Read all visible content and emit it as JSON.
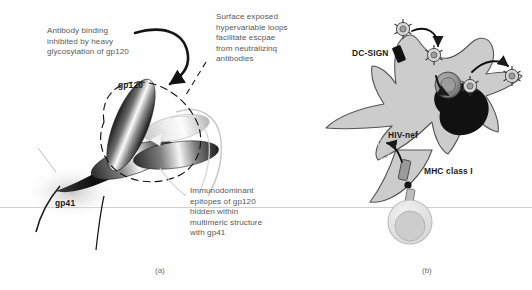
{
  "figure": {
    "background": "#fefefe",
    "membrane_color": "#c9c9c9",
    "text_color": "#58595b",
    "label_color": "#1a1a1a"
  },
  "panel_a": {
    "caption": "(a)",
    "annotations": [
      {
        "name": "antibody-binding-note",
        "text": "Antibody binding\ninhibited by heavy\nglycosylation of gp120"
      },
      {
        "name": "hypervariable-loops-note",
        "text": "Surface exposed\nhypervariable loops\nfacilitate escpae\nfrom neutralizinq\nantibodies"
      },
      {
        "name": "immunodominant-epitopes-note",
        "text": "Immunodominant\nepitopes of gp120\nhidden within\nmultimeric structure\nwith gp41"
      }
    ],
    "structure_labels": [
      {
        "name": "gp120-label",
        "text": "gp120"
      },
      {
        "name": "gp41-label",
        "text": "gp41"
      }
    ]
  },
  "panel_b": {
    "caption": "(b)",
    "structure_labels": [
      {
        "name": "dc-sign-label",
        "text": "DC-SIGN"
      },
      {
        "name": "hiv-nef-label",
        "text": "HIV-nef"
      },
      {
        "name": "mhc-class-i-label",
        "text": "MHC class I"
      }
    ],
    "elements": [
      {
        "name": "dendritic-cell",
        "kind": "cell-body"
      },
      {
        "name": "nucleus",
        "kind": "organelle"
      },
      {
        "name": "endosome",
        "kind": "organelle"
      },
      {
        "name": "virion",
        "kind": "virus-particle",
        "count": 5
      },
      {
        "name": "t-cell",
        "kind": "cell-body"
      }
    ]
  }
}
